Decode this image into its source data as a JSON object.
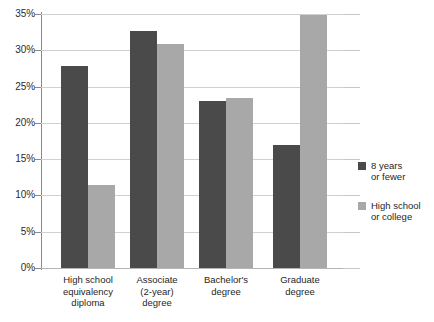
{
  "chart_data": {
    "type": "bar",
    "title": "",
    "xlabel": "",
    "ylabel": "",
    "ylim": [
      0,
      35
    ],
    "ytick_step": 5,
    "grid": true,
    "legend_position": "right",
    "value_suffix": "%",
    "categories": [
      "High school equivalency diploma",
      "Associate (2-year) degree",
      "Bachelor's degree",
      "Graduate degree"
    ],
    "category_lines": [
      [
        "High school",
        "equivalency",
        "diploma"
      ],
      [
        "Associate",
        "(2-year)",
        "degree"
      ],
      [
        "Bachelor's",
        "degree"
      ],
      [
        "Graduate",
        "degree"
      ]
    ],
    "ytick_labels": [
      "0%",
      "5%",
      "10%",
      "15%",
      "20%",
      "25%",
      "30%",
      "35%"
    ],
    "ytick_values": [
      0,
      5,
      10,
      15,
      20,
      25,
      30,
      35
    ],
    "series": [
      {
        "name": "8 years or fewer",
        "name_lines": [
          "8 years",
          "or fewer"
        ],
        "color": "#4a4a4a",
        "values": [
          27.8,
          32.7,
          23.0,
          16.9
        ]
      },
      {
        "name": "High school or college",
        "name_lines": [
          "High school",
          "or college"
        ],
        "color": "#a8a8a8",
        "values": [
          11.5,
          30.8,
          23.4,
          34.9
        ]
      }
    ]
  },
  "colors": {
    "series_dark": "#4a4a4a",
    "series_light": "#a8a8a8",
    "gridline": "#d0d0d0",
    "axis": "#8a8a8a",
    "text": "#1f1f1f",
    "background": "#ffffff"
  }
}
